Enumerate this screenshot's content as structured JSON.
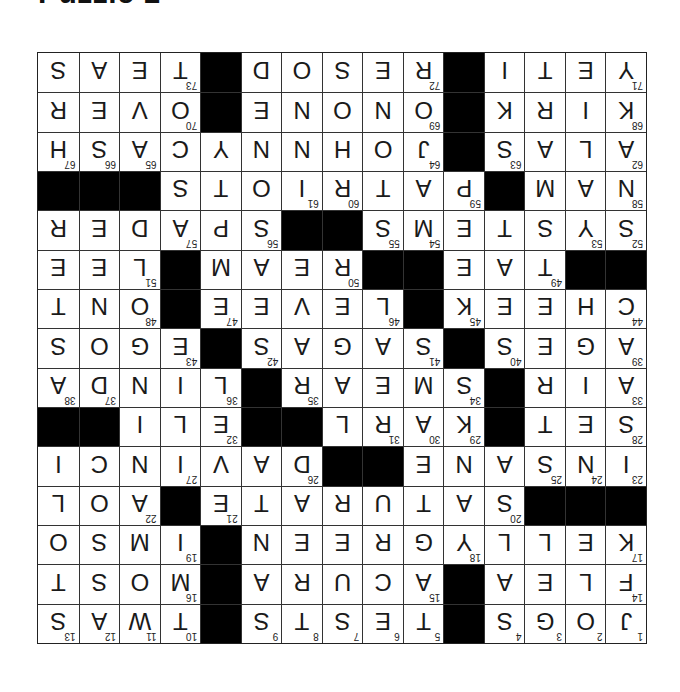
{
  "title": "Puzzle 1",
  "grid": {
    "rows": 15,
    "cols": 15,
    "orientation_degrees": 180,
    "colors": {
      "black": "#000000",
      "white": "#ffffff",
      "line": "#333333"
    },
    "cells": [
      [
        "J",
        "O",
        "G",
        "S",
        "#",
        "T",
        "E",
        "S",
        "T",
        "S",
        "#",
        "T",
        "W",
        "A",
        "S"
      ],
      [
        "F",
        "L",
        "E",
        "A",
        "#",
        "A",
        "C",
        "U",
        "R",
        "A",
        "#",
        "M",
        "O",
        "S",
        "T"
      ],
      [
        "K",
        "E",
        "L",
        "L",
        "Y",
        "G",
        "R",
        "E",
        "E",
        "N",
        "#",
        "I",
        "M",
        "S",
        "O"
      ],
      [
        "#",
        "#",
        "#",
        "S",
        "A",
        "T",
        "U",
        "R",
        "A",
        "T",
        "E",
        "#",
        "A",
        "O",
        "L"
      ],
      [
        "I",
        "N",
        "S",
        "A",
        "N",
        "E",
        "#",
        "#",
        "D",
        "A",
        "V",
        "I",
        "N",
        "C",
        "I"
      ],
      [
        "S",
        "E",
        "T",
        "#",
        "K",
        "A",
        "R",
        "L",
        "#",
        "#",
        "E",
        "L",
        "I",
        "#",
        "#"
      ],
      [
        "A",
        "I",
        "R",
        "#",
        "S",
        "M",
        "E",
        "A",
        "R",
        "#",
        "L",
        "I",
        "N",
        "D",
        "A"
      ],
      [
        "A",
        "G",
        "E",
        "S",
        "#",
        "S",
        "A",
        "G",
        "A",
        "S",
        "#",
        "E",
        "G",
        "O",
        "S"
      ],
      [
        "C",
        "H",
        "E",
        "E",
        "K",
        "#",
        "L",
        "E",
        "V",
        "E",
        "E",
        "#",
        "O",
        "N",
        "T"
      ],
      [
        "#",
        "#",
        "T",
        "A",
        "E",
        "#",
        "#",
        "R",
        "E",
        "A",
        "M",
        "#",
        "L",
        "E",
        "E"
      ],
      [
        "S",
        "Y",
        "S",
        "T",
        "E",
        "M",
        "S",
        "#",
        "#",
        "S",
        "P",
        "A",
        "D",
        "E",
        "R"
      ],
      [
        "N",
        "A",
        "M",
        "#",
        "P",
        "A",
        "T",
        "R",
        "I",
        "O",
        "T",
        "S",
        "#",
        "#",
        "#"
      ],
      [
        "A",
        "L",
        "A",
        "S",
        "#",
        "J",
        "O",
        "H",
        "N",
        "N",
        "Y",
        "C",
        "A",
        "S",
        "H"
      ],
      [
        "K",
        "I",
        "R",
        "K",
        "#",
        "O",
        "N",
        "O",
        "N",
        "E",
        "#",
        "O",
        "V",
        "E",
        "R"
      ],
      [
        "Y",
        "E",
        "T",
        "I",
        "#",
        "R",
        "E",
        "S",
        "O",
        "D",
        "#",
        "T",
        "E",
        "A",
        "S"
      ]
    ],
    "numbers": [
      [
        1,
        2,
        3,
        4,
        0,
        5,
        6,
        7,
        8,
        9,
        0,
        10,
        11,
        12,
        13
      ],
      [
        14,
        0,
        0,
        0,
        0,
        15,
        0,
        0,
        0,
        0,
        0,
        16,
        0,
        0,
        0
      ],
      [
        17,
        0,
        0,
        0,
        18,
        0,
        0,
        0,
        0,
        0,
        0,
        19,
        0,
        0,
        0
      ],
      [
        0,
        0,
        0,
        20,
        0,
        0,
        0,
        0,
        0,
        0,
        21,
        0,
        22,
        0,
        0
      ],
      [
        23,
        24,
        25,
        0,
        0,
        0,
        0,
        0,
        26,
        0,
        0,
        27,
        0,
        0,
        0
      ],
      [
        28,
        0,
        0,
        0,
        29,
        30,
        31,
        0,
        0,
        0,
        32,
        0,
        0,
        0,
        0
      ],
      [
        33,
        0,
        0,
        0,
        34,
        0,
        0,
        0,
        35,
        0,
        36,
        0,
        0,
        37,
        38
      ],
      [
        39,
        0,
        0,
        40,
        0,
        41,
        0,
        0,
        0,
        42,
        0,
        43,
        0,
        0,
        0
      ],
      [
        44,
        0,
        0,
        0,
        45,
        0,
        46,
        0,
        0,
        0,
        47,
        0,
        48,
        0,
        0
      ],
      [
        0,
        0,
        49,
        0,
        0,
        0,
        0,
        50,
        0,
        0,
        0,
        0,
        51,
        0,
        0
      ],
      [
        52,
        53,
        0,
        0,
        0,
        54,
        55,
        0,
        0,
        56,
        0,
        57,
        0,
        0,
        0
      ],
      [
        58,
        0,
        0,
        0,
        59,
        0,
        0,
        60,
        61,
        0,
        0,
        0,
        0,
        0,
        0
      ],
      [
        62,
        0,
        0,
        63,
        0,
        64,
        0,
        0,
        0,
        0,
        0,
        0,
        65,
        66,
        67
      ],
      [
        68,
        0,
        0,
        0,
        0,
        69,
        0,
        0,
        0,
        0,
        0,
        70,
        0,
        0,
        0
      ],
      [
        71,
        0,
        0,
        0,
        0,
        72,
        0,
        0,
        0,
        0,
        0,
        73,
        0,
        0,
        0
      ]
    ]
  }
}
